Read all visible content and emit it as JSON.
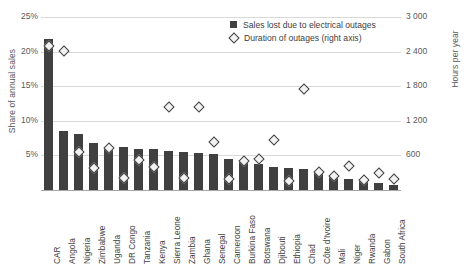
{
  "chart_data": {
    "type": "bar",
    "title": "",
    "subtitle": "",
    "xlabel": "",
    "ylabel": "Share of annual sales",
    "y2label": "Hours per year",
    "grid": true,
    "legend_position": "top-right",
    "ylim": [
      0,
      25
    ],
    "y2lim": [
      0,
      3000
    ],
    "ytick_labels": [
      "5%",
      "10%",
      "15%",
      "20%",
      "25%"
    ],
    "ytick_values": [
      5,
      10,
      15,
      20,
      25
    ],
    "y2tick_labels": [
      "600",
      "1 200",
      "1 800",
      "2 400",
      "3 000"
    ],
    "y2tick_values": [
      600,
      1200,
      1800,
      2400,
      3000
    ],
    "categories": [
      "CAR",
      "Angola",
      "Nigeria",
      "Zimbabwe",
      "Uganda",
      "DR Congo",
      "Tanzania",
      "Kenya",
      "Sierra Leone",
      "Zambia",
      "Ghana",
      "Senegal",
      "Cameroon",
      "Burkina Faso",
      "Botswana",
      "Djibouti",
      "Ethiopia",
      "Chad",
      "Côte d'Ivoire",
      "Mali",
      "Niger",
      "Rwanda",
      "Gabon",
      "South Africa"
    ],
    "series": [
      {
        "name": "Sales lost due to electrical outages",
        "axis": "left",
        "unit": "%",
        "marker": "bar",
        "color": "#404040",
        "values": [
          22.0,
          8.6,
          8.2,
          7.0,
          6.4,
          6.3,
          6.1,
          6.0,
          5.8,
          5.6,
          5.5,
          5.4,
          4.6,
          4.3,
          3.9,
          3.5,
          3.3,
          3.2,
          2.7,
          2.0,
          1.7,
          1.5,
          1.2,
          0.9
        ]
      },
      {
        "name": "Duration of outages (right axis)",
        "axis": "right",
        "unit": "hours per year",
        "marker": "diamond",
        "color": "#404040",
        "values": [
          2500,
          2410,
          660,
          380,
          730,
          200,
          520,
          400,
          1440,
          210,
          1440,
          840,
          190,
          500,
          540,
          870,
          150,
          1760,
          310,
          250,
          420,
          180,
          300,
          190
        ]
      }
    ]
  },
  "legend": {
    "items": [
      {
        "label": "Sales lost due to electrical outages",
        "marker": "square"
      },
      {
        "label": "Duration of outages (right axis)",
        "marker": "diamond"
      }
    ]
  },
  "axes": {
    "left_title": "Share of annual sales",
    "right_title": "Hours per year"
  }
}
